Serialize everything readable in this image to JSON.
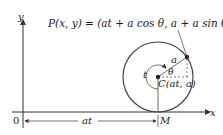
{
  "diagram": {
    "title_formula": "P(x, y) = (at + a cos θ, a + a sin θ)",
    "axes": {
      "x_label": "x",
      "y_label": "y",
      "origin_label": "0"
    },
    "labels": {
      "radius": "a",
      "angle": "θ",
      "rotation": "t",
      "center": "C(at, a)",
      "contact_point": "M",
      "distance": "at"
    },
    "colors": {
      "stroke": "#333333",
      "text": "#1a1a1a"
    }
  }
}
